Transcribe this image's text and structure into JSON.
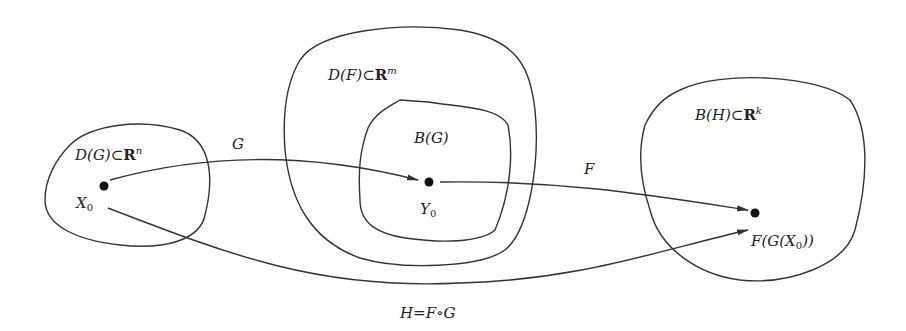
{
  "diagram": {
    "sets": [
      {
        "id": "DG",
        "label_main": "D(G)⊂",
        "label_R": "R",
        "label_exp": "n"
      },
      {
        "id": "DF",
        "label_main": "D(F)⊂",
        "label_R": "R",
        "label_exp": "m"
      },
      {
        "id": "BG",
        "label_main": "B(G)"
      },
      {
        "id": "BH",
        "label_main": "B(H)⊂",
        "label_R": "R",
        "label_exp": "k"
      }
    ],
    "points": {
      "x0": {
        "base": "X",
        "sub": "0"
      },
      "y0": {
        "base": "Y",
        "sub": "0"
      },
      "fgx0": {
        "pre": "F(G(X",
        "sub": "0",
        "post": "))"
      }
    },
    "arrows": {
      "G": "G",
      "F": "F"
    },
    "caption": "H=F∘G",
    "colors": {
      "stroke": "#333333",
      "background": "#ffffff"
    }
  }
}
